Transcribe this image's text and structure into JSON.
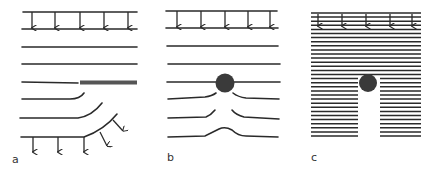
{
  "figure": {
    "panels": [
      {
        "id": "a",
        "label": "a",
        "description": "field lines bending around an edge of a thick barrier"
      },
      {
        "id": "b",
        "label": "b",
        "description": "field lines deflected around a dark circular obstacle"
      },
      {
        "id": "c",
        "label": "c",
        "description": "dense field lines with a shadow region below a circular obstacle"
      }
    ],
    "colors": {
      "line": "#2a2a2a",
      "barrier": "#555555",
      "obstacle": "#3a3a3a",
      "background": "#ffffff"
    },
    "icons": {
      "arrow": "down-arrow-icon",
      "obstacle": "filled-circle"
    }
  }
}
